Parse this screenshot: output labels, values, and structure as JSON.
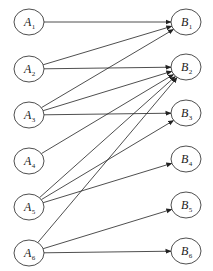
{
  "diagram": {
    "type": "bipartite-directed-graph",
    "left_nodes": [
      {
        "id": "A1",
        "letter": "A",
        "sub": "1",
        "cx": 29,
        "cy": 22
      },
      {
        "id": "A2",
        "letter": "A",
        "sub": "2",
        "cx": 29,
        "cy": 69
      },
      {
        "id": "A3",
        "letter": "A",
        "sub": "3",
        "cx": 29,
        "cy": 115
      },
      {
        "id": "A4",
        "letter": "A",
        "sub": "4",
        "cx": 29,
        "cy": 161
      },
      {
        "id": "A5",
        "letter": "A",
        "sub": "5",
        "cx": 29,
        "cy": 207
      },
      {
        "id": "A6",
        "letter": "A",
        "sub": "6",
        "cx": 29,
        "cy": 253
      }
    ],
    "right_nodes": [
      {
        "id": "B1",
        "letter": "B",
        "sub": "1",
        "cx": 186,
        "cy": 22
      },
      {
        "id": "B2",
        "letter": "B",
        "sub": "2",
        "cx": 186,
        "cy": 67
      },
      {
        "id": "B3",
        "letter": "B",
        "sub": "3",
        "cx": 186,
        "cy": 113
      },
      {
        "id": "B4",
        "letter": "B",
        "sub": "4",
        "cx": 186,
        "cy": 159
      },
      {
        "id": "B5",
        "letter": "B",
        "sub": "5",
        "cx": 186,
        "cy": 205
      },
      {
        "id": "B6",
        "letter": "B",
        "sub": "6",
        "cx": 186,
        "cy": 251
      }
    ],
    "edges": [
      {
        "from": "A1",
        "to": "B1"
      },
      {
        "from": "A2",
        "to": "B1"
      },
      {
        "from": "A2",
        "to": "B2"
      },
      {
        "from": "A3",
        "to": "B1"
      },
      {
        "from": "A3",
        "to": "B2"
      },
      {
        "from": "A3",
        "to": "B3"
      },
      {
        "from": "A4",
        "to": "B2"
      },
      {
        "from": "A5",
        "to": "B2"
      },
      {
        "from": "A5",
        "to": "B3"
      },
      {
        "from": "A5",
        "to": "B4"
      },
      {
        "from": "A6",
        "to": "B2"
      },
      {
        "from": "A6",
        "to": "B5"
      },
      {
        "from": "A6",
        "to": "B6"
      }
    ],
    "style": {
      "stroke": "#222222",
      "background": "#ffffff",
      "rx": 15,
      "ry": 13
    }
  }
}
